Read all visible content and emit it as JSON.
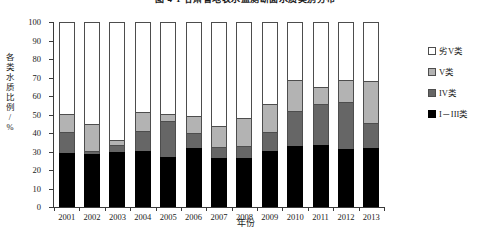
{
  "figure": {
    "title": "图 4-1  甘肃省地表水监测断面水质类别分布",
    "ylabel": "各类水质比例/%",
    "xlabel": "年份"
  },
  "legend": {
    "position": "right",
    "items": [
      {
        "label": "劣V类",
        "color": "#ffffff",
        "swatch": "white-swatch"
      },
      {
        "label": "V类",
        "color": "#b3b3b3",
        "swatch": "light-gray-swatch"
      },
      {
        "label": "IV类",
        "color": "#666666",
        "swatch": "dark-gray-swatch"
      },
      {
        "label": "I－III类",
        "color": "#000000",
        "swatch": "black-swatch"
      }
    ]
  },
  "axes": {
    "y_ticks": [
      0,
      10,
      20,
      30,
      40,
      50,
      60,
      70,
      80,
      90,
      100
    ],
    "ylim": [
      0,
      100
    ],
    "x_ticks": [
      "2001",
      "2002",
      "2003",
      "2004",
      "2005",
      "2006",
      "2007",
      "2008",
      "2009",
      "2010",
      "2011",
      "2012",
      "2013"
    ]
  },
  "chart_data": {
    "type": "bar",
    "stacked": true,
    "title": "图 4-1  甘肃省地表水监测断面水质类别分布",
    "xlabel": "年份",
    "ylabel": "各类水质比例/%",
    "ylim": [
      0,
      100
    ],
    "grid": false,
    "legend_position": "right",
    "categories": [
      "2001",
      "2002",
      "2003",
      "2004",
      "2005",
      "2006",
      "2007",
      "2008",
      "2009",
      "2010",
      "2011",
      "2012",
      "2013"
    ],
    "series": [
      {
        "name": "I－III类",
        "color": "#000000",
        "values": [
          29.0,
          28.5,
          29.5,
          30.5,
          27.0,
          32.0,
          26.5,
          26.5,
          30.5,
          33.0,
          33.5,
          31.5,
          32.0
        ]
      },
      {
        "name": "IV类",
        "color": "#666666",
        "values": [
          11.5,
          2.0,
          4.0,
          10.5,
          19.5,
          8.0,
          6.0,
          6.5,
          10.0,
          19.0,
          22.0,
          25.5,
          13.5
        ]
      },
      {
        "name": "V类",
        "color": "#b3b3b3",
        "values": [
          10.0,
          14.5,
          2.5,
          10.5,
          4.0,
          9.0,
          11.5,
          15.0,
          15.0,
          16.5,
          9.5,
          11.5,
          22.5
        ]
      },
      {
        "name": "劣V类",
        "color": "#ffffff",
        "values": [
          49.5,
          55.0,
          64.0,
          48.5,
          49.5,
          51.0,
          56.0,
          52.0,
          44.5,
          31.5,
          35.0,
          31.5,
          32.0
        ]
      }
    ],
    "cumulative_tops": {
      "I－III类": [
        29.0,
        28.5,
        29.5,
        30.5,
        27.0,
        32.0,
        26.5,
        26.5,
        30.5,
        33.0,
        33.5,
        31.5,
        32.0
      ],
      "IV类": [
        40.5,
        30.5,
        33.5,
        41.0,
        46.5,
        40.0,
        32.5,
        33.0,
        40.5,
        52.0,
        55.5,
        57.0,
        45.5
      ],
      "V类": [
        50.5,
        45.0,
        36.0,
        51.5,
        50.5,
        49.0,
        44.0,
        48.0,
        55.5,
        68.5,
        65.0,
        68.5,
        68.0
      ],
      "劣V类": [
        100,
        100,
        100,
        100,
        100,
        100,
        100,
        100,
        100,
        100,
        100,
        100,
        100
      ]
    }
  }
}
